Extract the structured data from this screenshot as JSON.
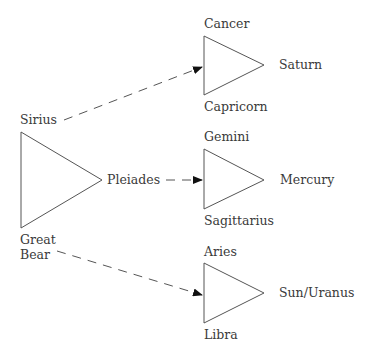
{
  "diagram": {
    "source_group": {
      "top_label": "Sirius",
      "apex_label": "Pleiades",
      "bottom_label_line1": "Great",
      "bottom_label_line2": "Bear"
    },
    "target_groups": [
      {
        "top_label": "Cancer",
        "bottom_label": "Capricorn",
        "apex_label": "Saturn"
      },
      {
        "top_label": "Gemini",
        "bottom_label": "Sagittarius",
        "apex_label": "Mercury"
      },
      {
        "top_label": "Aries",
        "bottom_label": "Libra",
        "apex_label": "Sun/Uranus"
      }
    ],
    "arrows": [
      {
        "from": "Sirius",
        "to": "Cancer/Capricorn triangle",
        "style": "dashed"
      },
      {
        "from": "Pleiades",
        "to": "Gemini/Sagittarius triangle",
        "style": "dashed"
      },
      {
        "from": "Great Bear",
        "to": "Aries/Libra triangle",
        "style": "dashed"
      }
    ],
    "colors": {
      "line": "#555555",
      "arrowhead": "#111111",
      "text": "#3a3a3a"
    }
  }
}
